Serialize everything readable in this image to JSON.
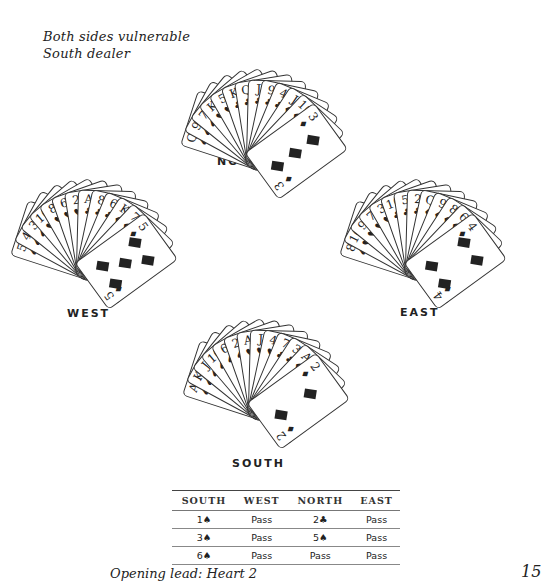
{
  "conditions": {
    "vulnerability": "Both sides vulnerable",
    "dealer": "South dealer"
  },
  "suit_symbols": {
    "S": "♠",
    "H": "♥",
    "D": "♦",
    "C": "♣"
  },
  "hands": {
    "north": {
      "label": "NORTH",
      "label_pos": [
        217,
        155
      ],
      "pivot": [
        258,
        158
      ],
      "start_angle": -72,
      "step": 10.5,
      "cards": [
        {
          "rank": "Q",
          "suit": "S"
        },
        {
          "rank": "9",
          "suit": "S"
        },
        {
          "rank": "7",
          "suit": "S"
        },
        {
          "rank": "K",
          "suit": "H"
        },
        {
          "rank": "5",
          "suit": "H"
        },
        {
          "rank": "K",
          "suit": "C"
        },
        {
          "rank": "Q",
          "suit": "C"
        },
        {
          "rank": "J",
          "suit": "C"
        },
        {
          "rank": "9",
          "suit": "C"
        },
        {
          "rank": "4",
          "suit": "C"
        },
        {
          "rank": "J",
          "suit": "D"
        },
        {
          "rank": "10",
          "suit": "D"
        },
        {
          "rank": "3",
          "suit": "D"
        }
      ],
      "face_pips": 3
    },
    "west": {
      "label": "WEST",
      "label_pos": [
        67,
        307
      ],
      "pivot": [
        88,
        268
      ],
      "start_angle": -72,
      "step": 10.5,
      "cards": [
        {
          "rank": "5",
          "suit": "S"
        },
        {
          "rank": "4",
          "suit": "S"
        },
        {
          "rank": "3",
          "suit": "S"
        },
        {
          "rank": "10",
          "suit": "H"
        },
        {
          "rank": "8",
          "suit": "H"
        },
        {
          "rank": "6",
          "suit": "H"
        },
        {
          "rank": "2",
          "suit": "H"
        },
        {
          "rank": "A",
          "suit": "C"
        },
        {
          "rank": "8",
          "suit": "C"
        },
        {
          "rank": "6",
          "suit": "C"
        },
        {
          "rank": "K",
          "suit": "D"
        },
        {
          "rank": "7",
          "suit": "D"
        },
        {
          "rank": "5",
          "suit": "D"
        }
      ],
      "face_pips": 5
    },
    "east": {
      "label": "EAST",
      "label_pos": [
        400,
        306
      ],
      "pivot": [
        417,
        268
      ],
      "start_angle": -72,
      "step": 10.5,
      "cards": [
        {
          "rank": "8",
          "suit": "S"
        },
        {
          "rank": "10",
          "suit": "H"
        },
        {
          "rank": "9",
          "suit": "H"
        },
        {
          "rank": "7",
          "suit": "H"
        },
        {
          "rank": "3",
          "suit": "H"
        },
        {
          "rank": "10",
          "suit": "C"
        },
        {
          "rank": "5",
          "suit": "C"
        },
        {
          "rank": "2",
          "suit": "C"
        },
        {
          "rank": "Q",
          "suit": "D"
        },
        {
          "rank": "9",
          "suit": "D"
        },
        {
          "rank": "8",
          "suit": "D"
        },
        {
          "rank": "6",
          "suit": "D"
        },
        {
          "rank": "4",
          "suit": "D"
        }
      ],
      "face_pips": 4
    },
    "south": {
      "label": "SOUTH",
      "label_pos": [
        232,
        457
      ],
      "pivot": [
        260,
        408
      ],
      "start_angle": -72,
      "step": 10.5,
      "cards": [
        {
          "rank": "A",
          "suit": "S"
        },
        {
          "rank": "K",
          "suit": "S"
        },
        {
          "rank": "J",
          "suit": "S"
        },
        {
          "rank": "10",
          "suit": "S"
        },
        {
          "rank": "6",
          "suit": "S"
        },
        {
          "rank": "2",
          "suit": "S"
        },
        {
          "rank": "A",
          "suit": "H"
        },
        {
          "rank": "J",
          "suit": "H"
        },
        {
          "rank": "4",
          "suit": "H"
        },
        {
          "rank": "7",
          "suit": "C"
        },
        {
          "rank": "3",
          "suit": "C"
        },
        {
          "rank": "A",
          "suit": "D"
        },
        {
          "rank": "2",
          "suit": "D"
        }
      ],
      "face_pips": 2
    }
  },
  "auction": {
    "headers": [
      "SOUTH",
      "WEST",
      "NORTH",
      "EAST"
    ],
    "rows": [
      [
        "1♠",
        "Pass",
        "2♣",
        "Pass"
      ],
      [
        "3♠",
        "Pass",
        "5♠",
        "Pass"
      ],
      [
        "6♠",
        "Pass",
        "Pass",
        "Pass"
      ]
    ]
  },
  "opening_lead": "Opening lead: Heart 2",
  "page_number": "15"
}
